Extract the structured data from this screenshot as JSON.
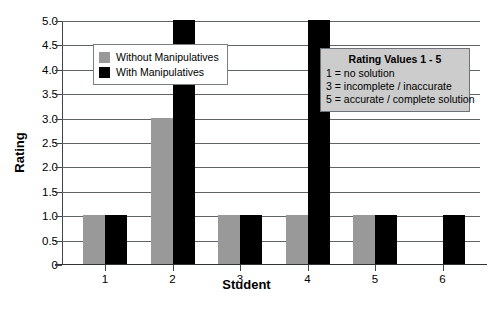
{
  "chart_data": {
    "type": "bar",
    "title": "",
    "xlabel": "Student",
    "ylabel": "Rating",
    "categories": [
      "1",
      "2",
      "3",
      "4",
      "5",
      "6"
    ],
    "series": [
      {
        "name": "Without Manipulatives",
        "color": "#999999",
        "values": [
          1,
          3,
          1,
          1,
          1,
          null
        ]
      },
      {
        "name": "With Manipulatives",
        "color": "#000000",
        "values": [
          1,
          5,
          1,
          5,
          1,
          1
        ]
      }
    ],
    "ylim": [
      0,
      5
    ],
    "ytick_labels": [
      "0",
      "0.5",
      "1.0",
      "1.5",
      "2.0",
      "2.5",
      "3.0",
      "3.5",
      "4.0",
      "4.5",
      "5.0"
    ],
    "ytick_values": [
      0,
      0.5,
      1.0,
      1.5,
      2.0,
      2.5,
      3.0,
      3.5,
      4.0,
      4.5,
      5.0
    ],
    "grid": true,
    "legend_position": "upper-left",
    "annotations": [
      {
        "title": "Rating Values 1 - 5",
        "lines": [
          "1 = no solution",
          "3 = incomplete / inaccurate",
          "5 = accurate / complete solution"
        ],
        "position": "upper-right"
      }
    ]
  },
  "legend": {
    "entries": [
      {
        "label": "Without Manipulatives",
        "color": "#999999"
      },
      {
        "label": "With Manipulatives",
        "color": "#000000"
      }
    ]
  },
  "annotation": {
    "title": "Rating Values 1 - 5",
    "line1": "1 = no solution",
    "line2": "3 = incomplete / inaccurate",
    "line3": "5 = accurate / complete solution"
  },
  "axes": {
    "y_title": "Rating",
    "x_title": "Student"
  }
}
